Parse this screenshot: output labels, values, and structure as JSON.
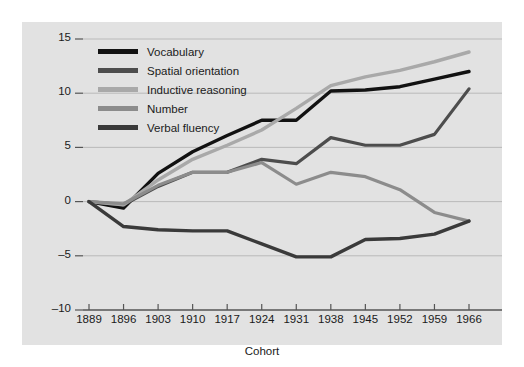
{
  "chart_data": {
    "type": "line",
    "title": "",
    "xlabel": "Cohort",
    "ylabel": "Mean T Scores",
    "categories": [
      1889,
      1896,
      1903,
      1910,
      1917,
      1924,
      1931,
      1938,
      1945,
      1952,
      1959,
      1966
    ],
    "x": [
      1889,
      1896,
      1903,
      1910,
      1917,
      1924,
      1931,
      1938,
      1945,
      1952,
      1959,
      1966
    ],
    "xlim": [
      1889,
      1966
    ],
    "ylim": [
      -10,
      15
    ],
    "yticks": [
      -10,
      -5,
      0,
      5,
      10,
      15
    ],
    "ytick_labels": [
      "–10",
      "–5",
      "0",
      "5",
      "10",
      "15"
    ],
    "xticks": [
      1889,
      1896,
      1903,
      1910,
      1917,
      1924,
      1931,
      1938,
      1945,
      1952,
      1959,
      1966
    ],
    "xtick_labels": [
      "1889",
      "1896",
      "1903",
      "1910",
      "1917",
      "1924",
      "1931",
      "1938",
      "1945",
      "1952",
      "1959",
      "1966"
    ],
    "grid": true,
    "grid_axis": "y",
    "legend_position": "upper-left-inside",
    "series": [
      {
        "name": "Vocabulary",
        "color": "#121212",
        "width": 3.4,
        "values": [
          0.0,
          -0.6,
          2.6,
          4.6,
          6.1,
          7.5,
          7.5,
          10.2,
          10.3,
          10.6,
          11.3,
          12.0
        ]
      },
      {
        "name": "Spatial orientation",
        "color": "#4d4d4d",
        "width": 3.2,
        "values": [
          0.0,
          -0.3,
          1.4,
          2.7,
          2.7,
          3.9,
          3.5,
          5.9,
          5.2,
          5.2,
          6.2,
          10.4
        ]
      },
      {
        "name": "Inductive reasoning",
        "color": "#a9a9a9",
        "width": 3.4,
        "values": [
          0.0,
          -0.3,
          2.0,
          3.9,
          5.2,
          6.6,
          8.6,
          10.7,
          11.5,
          12.1,
          12.9,
          13.8
        ]
      },
      {
        "name": "Number",
        "color": "#8c8c8c",
        "width": 3.2,
        "values": [
          0.0,
          -0.2,
          1.5,
          2.7,
          2.7,
          3.6,
          1.6,
          2.7,
          2.3,
          1.1,
          -1.0,
          -1.8
        ]
      },
      {
        "name": "Verbal fluency",
        "color": "#3a3a3a",
        "width": 3.4,
        "values": [
          0.0,
          -2.3,
          -2.6,
          -2.7,
          -2.7,
          -3.9,
          -5.1,
          -5.1,
          -3.5,
          -3.4,
          -3.0,
          -1.8
        ]
      }
    ]
  },
  "panel": {
    "background": "#e2e2e2",
    "grid_color": "#b6b6b6",
    "axis_color": "#555555"
  }
}
